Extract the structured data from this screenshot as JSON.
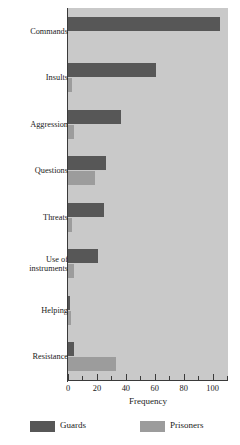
{
  "chart_data": {
    "type": "bar",
    "orientation": "horizontal",
    "title": "",
    "xlabel": "Frequency",
    "ylabel": "",
    "xlim": [
      0,
      110
    ],
    "xticks": [
      0,
      20,
      40,
      60,
      80,
      100
    ],
    "xtick_labels": [
      "0",
      "20",
      "40",
      "60",
      "80",
      "100"
    ],
    "grid": false,
    "legend_position": "bottom",
    "categories": [
      "Commands",
      "Insults",
      "Aggression",
      "Questions",
      "Threats",
      "Use of\ninstruments",
      "Helping",
      "Resistance"
    ],
    "series": [
      {
        "name": "Guards",
        "color": "#575757",
        "values": [
          105,
          61,
          37,
          26,
          25,
          21,
          1,
          4
        ]
      },
      {
        "name": "Prisoners",
        "color": "#9c9c9c",
        "values": [
          0,
          3,
          4,
          19,
          3,
          4,
          2,
          33
        ]
      }
    ]
  },
  "legend": {
    "items": [
      {
        "label": "Guards",
        "swatch": "guards"
      },
      {
        "label": "Prisoners",
        "swatch": "prisoners"
      }
    ]
  },
  "colors": {
    "plot_background": "#c9c9c9",
    "guards": "#575757",
    "prisoners": "#9c9c9c",
    "axis": "#3a3a3a",
    "text": "#1a1a1a"
  }
}
